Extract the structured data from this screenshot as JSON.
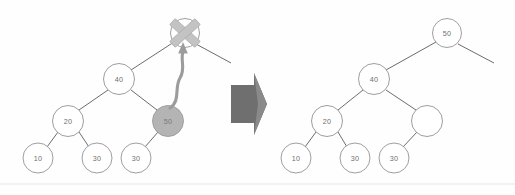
{
  "figure": {
    "colors": {
      "node_stroke": "#8d8d8d",
      "node_fill": "#ffffff",
      "highlight_fill": "#b4b4b4",
      "edge": "#5b5b5b",
      "cross_mark": "#c3c3c3",
      "move_arrow": "#9c9c9c",
      "block_arrow": "#6f6f6f",
      "label_text": "#6e6e6e",
      "background": "#fefefe",
      "rule": "#e3e6ea"
    }
  },
  "before_tree": {
    "name": "before-tree",
    "nodes": [
      {
        "id": "b-70",
        "label": "70",
        "cx": 185,
        "cy": 33,
        "r": 14.5,
        "state": "deleted",
        "crossed_out": true
      },
      {
        "id": "b-40",
        "label": "40",
        "cx": 119,
        "cy": 79,
        "r": 15.5,
        "state": "normal",
        "crossed_out": false
      },
      {
        "id": "b-20",
        "label": "20",
        "cx": 68,
        "cy": 121,
        "r": 15.5,
        "state": "normal",
        "crossed_out": false
      },
      {
        "id": "b-50",
        "label": "50",
        "cx": 168,
        "cy": 121,
        "r": 15.5,
        "state": "highlighted",
        "crossed_out": false
      },
      {
        "id": "b-10",
        "label": "10",
        "cx": 38,
        "cy": 158,
        "r": 15.0,
        "state": "normal",
        "crossed_out": false
      },
      {
        "id": "b-30l",
        "label": "30",
        "cx": 97,
        "cy": 158,
        "r": 15.0,
        "state": "normal",
        "crossed_out": false
      },
      {
        "id": "b-30r",
        "label": "30",
        "cx": 136,
        "cy": 158,
        "r": 15.0,
        "state": "normal",
        "crossed_out": false
      }
    ],
    "edges": [
      {
        "from": "b-70",
        "to": "b-40"
      },
      {
        "from": "b-40",
        "to": "b-20"
      },
      {
        "from": "b-40",
        "to": "b-50"
      },
      {
        "from": "b-20",
        "to": "b-10"
      },
      {
        "from": "b-20",
        "to": "b-30l"
      },
      {
        "from": "b-50",
        "to": "b-30r"
      }
    ],
    "stub_edges": [
      {
        "name": "parent-stub-right",
        "x1": 196,
        "y1": 44,
        "x2": 231,
        "y2": 63
      }
    ],
    "cross_mark": {
      "name": "delete-cross",
      "cx": 185,
      "cy": 33,
      "size": 30
    },
    "move_arrow": {
      "name": "replacement-move-arrow",
      "from_node": "b-50",
      "to_node": "b-70",
      "description": "curved wavy arrow from node 50 up to node 70"
    }
  },
  "transition_arrow": {
    "name": "transition-block-arrow",
    "direction": "right",
    "x": 229,
    "y": 73,
    "width": 38,
    "height": 62
  },
  "after_tree": {
    "name": "after-tree",
    "nodes": [
      {
        "id": "a-50",
        "label": "50",
        "cx": 447,
        "cy": 33,
        "r": 14.5,
        "state": "normal"
      },
      {
        "id": "a-40",
        "label": "40",
        "cx": 374,
        "cy": 79,
        "r": 15.5,
        "state": "normal"
      },
      {
        "id": "a-20",
        "label": "20",
        "cx": 327,
        "cy": 121,
        "r": 15.5,
        "state": "normal"
      },
      {
        "id": "a-empty",
        "label": "",
        "cx": 427,
        "cy": 121,
        "r": 15.5,
        "state": "empty"
      },
      {
        "id": "a-10",
        "label": "10",
        "cx": 296,
        "cy": 158,
        "r": 15.0,
        "state": "normal"
      },
      {
        "id": "a-30l",
        "label": "30",
        "cx": 355,
        "cy": 158,
        "r": 15.0,
        "state": "normal"
      },
      {
        "id": "a-30r",
        "label": "30",
        "cx": 394,
        "cy": 158,
        "r": 15.0,
        "state": "normal"
      }
    ],
    "edges": [
      {
        "from": "a-50",
        "to": "a-40"
      },
      {
        "from": "a-40",
        "to": "a-20"
      },
      {
        "from": "a-40",
        "to": "a-empty"
      },
      {
        "from": "a-20",
        "to": "a-10"
      },
      {
        "from": "a-20",
        "to": "a-30l"
      },
      {
        "from": "a-empty",
        "to": "a-30r"
      }
    ],
    "stub_edges": [
      {
        "name": "root-stub-right",
        "x1": 458,
        "y1": 44,
        "x2": 494,
        "y2": 63
      }
    ]
  },
  "page_rule": {
    "name": "page-bottom-rule",
    "y": 184
  }
}
